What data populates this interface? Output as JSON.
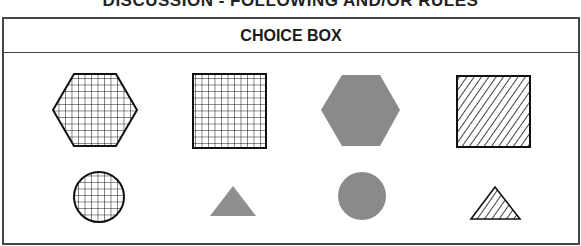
{
  "page": {
    "top_title": "DISCUSSION - FOLLOWING AND/OR RULES"
  },
  "choice_box": {
    "title": "CHOICE BOX",
    "rows": [
      {
        "items": [
          {
            "shape": "hexagon",
            "fill": "grid",
            "border": "black"
          },
          {
            "shape": "square",
            "fill": "grid",
            "border": "black"
          },
          {
            "shape": "hexagon",
            "fill": "solid-gray",
            "border": "none"
          },
          {
            "shape": "square",
            "fill": "diagonal-stripes",
            "border": "black"
          }
        ]
      },
      {
        "items": [
          {
            "shape": "circle",
            "fill": "grid",
            "border": "black"
          },
          {
            "shape": "triangle",
            "fill": "solid-gray",
            "border": "none"
          },
          {
            "shape": "circle",
            "fill": "solid-gray",
            "border": "none"
          },
          {
            "shape": "triangle",
            "fill": "diagonal-stripes",
            "border": "black"
          }
        ]
      }
    ]
  },
  "colors": {
    "gray_fill": "#8a8a8a",
    "line": "#111111",
    "border": "#444444"
  }
}
